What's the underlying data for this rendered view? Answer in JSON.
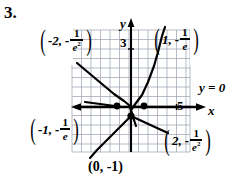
{
  "problem": {
    "number": "3."
  },
  "figure": {
    "type": "graph",
    "grid": {
      "x": 72,
      "y": 30,
      "width": 118,
      "height": 122,
      "cell": 9.5,
      "color": "#8f96a6",
      "visible": true
    },
    "axes": {
      "x_axis_label": "x",
      "y_axis_label": "y",
      "x_axis_y_px": 107,
      "y_axis_x_px": 131,
      "x_tick_label": "5",
      "y_tick_label": "3",
      "asymptote_label": "y = 0"
    },
    "points": [
      {
        "id": "top-left",
        "label_parts": {
          "x": "-2,",
          "sign": "-",
          "num": "1",
          "den": "e",
          "exp": "2"
        },
        "x": -2,
        "y": -0.1353
      },
      {
        "id": "top-right",
        "label_parts": {
          "x": "1,",
          "sign": "-",
          "num": "1",
          "den": "e",
          "exp": ""
        },
        "x": 1,
        "y": -0.3679
      },
      {
        "id": "bottom-left",
        "label_parts": {
          "x": "-1,",
          "sign": "-",
          "num": "1",
          "den": "e",
          "exp": ""
        },
        "x": -1,
        "y": -0.3679
      },
      {
        "id": "bottom-right",
        "label_parts": {
          "x": "2,",
          "sign": "-",
          "num": "1",
          "den": "e",
          "exp": "2"
        },
        "x": 2,
        "y": -0.1353
      },
      {
        "id": "bottom-center",
        "text": "(0, -1)",
        "x": 0,
        "y": -1
      }
    ],
    "colors": {
      "ink": "#000000",
      "grid": "#8f96a6",
      "paper": "#ffffff"
    }
  }
}
